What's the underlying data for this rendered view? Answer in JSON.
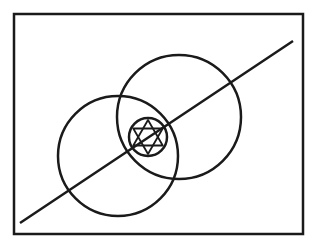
{
  "diagram": {
    "background": "#ffffff",
    "stroke_color": "#1a1a1a",
    "frame": {
      "x": 14,
      "y": 14,
      "width": 289,
      "height": 220,
      "stroke_width": 2.5
    },
    "diagonal_line": {
      "x1": 20,
      "y1": 223,
      "x2": 293,
      "y2": 41,
      "stroke_width": 2.5
    },
    "circles": [
      {
        "name": "left-circle",
        "cx": 118,
        "cy": 156,
        "r": 60,
        "stroke_width": 2.5
      },
      {
        "name": "right-circle",
        "cx": 179,
        "cy": 117,
        "r": 62,
        "stroke_width": 2.5
      },
      {
        "name": "center-small-circle",
        "cx": 148,
        "cy": 137,
        "r": 19,
        "stroke_width": 2.5
      }
    ],
    "hexagram": {
      "cx": 148,
      "cy": 137,
      "r": 17,
      "stroke_width": 1.8,
      "rotation_deg": 0
    }
  }
}
